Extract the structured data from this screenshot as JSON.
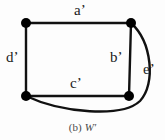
{
  "figure": {
    "caption_prefix": "(b)",
    "caption_name": "W′",
    "background_color": "#fdfdfd",
    "stroke_color": "#111111",
    "node_color": "#000000"
  },
  "graph": {
    "type": "undirected-multigraph",
    "nodes": [
      {
        "id": "v1",
        "name": "top-left-vertex",
        "x": 26,
        "y": 23,
        "r": 5
      },
      {
        "id": "v2",
        "name": "top-right-vertex",
        "x": 131,
        "y": 23,
        "r": 5
      },
      {
        "id": "v3",
        "name": "bottom-left-vertex",
        "x": 26,
        "y": 96,
        "r": 5
      },
      {
        "id": "v4",
        "name": "bottom-right-vertex",
        "x": 129,
        "y": 96,
        "r": 5
      }
    ],
    "edges": [
      {
        "id": "a",
        "label": "a’",
        "name": "edge-a-prime",
        "from": "v1",
        "to": "v2",
        "shape": "straight",
        "path": "M 26 23 L 131 23",
        "label_x": 74,
        "label_y": 3
      },
      {
        "id": "d",
        "label": "d’",
        "name": "edge-d-prime",
        "from": "v1",
        "to": "v3",
        "shape": "straight",
        "path": "M 26 23 L 26 96",
        "label_x": 6,
        "label_y": 50
      },
      {
        "id": "b",
        "label": "b’",
        "name": "edge-b-prime",
        "from": "v2",
        "to": "v4",
        "shape": "straight",
        "path": "M 131 23 L 129 96",
        "label_x": 110,
        "label_y": 50
      },
      {
        "id": "c",
        "label": "c’",
        "name": "edge-c-prime",
        "from": "v3",
        "to": "v4",
        "shape": "straight",
        "path": "M 26 96 L 129 96",
        "label_x": 70,
        "label_y": 76
      },
      {
        "id": "e",
        "label": "e’",
        "name": "edge-e-prime",
        "from": "v2",
        "to": "v3",
        "shape": "curved",
        "path": "M 131 23 C 152 42 156 84 140 101 C 122 118 62 113 26 96",
        "label_x": 143,
        "label_y": 62
      }
    ]
  }
}
